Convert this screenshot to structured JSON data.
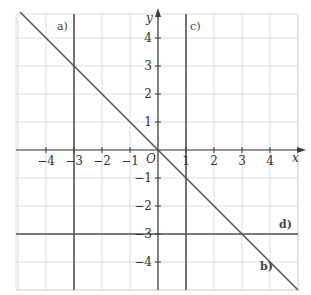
{
  "chart_data": {
    "type": "line",
    "title": "",
    "xlabel": "x",
    "ylabel": "y",
    "origin_label": "O",
    "xlim": [
      -5,
      5
    ],
    "ylim": [
      -5,
      5
    ],
    "grid": true,
    "x_ticks": [
      -4,
      -3,
      -2,
      -1,
      1,
      2,
      3,
      4
    ],
    "y_ticks": [
      -4,
      -3,
      -2,
      -1,
      1,
      2,
      3,
      4
    ],
    "x_tick_labels": [
      "−4",
      "−3",
      "−2",
      "−1",
      "1",
      "2",
      "3",
      "4"
    ],
    "y_tick_labels": [
      "−4",
      "−3",
      "−2",
      "−1",
      "1",
      "2",
      "3",
      "4"
    ],
    "series": [
      {
        "name": "a)",
        "equation": "x = -3",
        "kind": "vertical",
        "value": -3
      },
      {
        "name": "b)",
        "equation": "y = -x",
        "kind": "linear",
        "slope": -1,
        "intercept": 0,
        "x": [
          -5,
          5
        ],
        "y": [
          5,
          -5
        ]
      },
      {
        "name": "c)",
        "equation": "x = 1",
        "kind": "vertical",
        "value": 1
      },
      {
        "name": "d)",
        "equation": "y = -3",
        "kind": "horizontal",
        "value": -3
      }
    ]
  },
  "labels": {
    "x_axis": "x",
    "y_axis": "y",
    "origin": "O",
    "line_a": "a)",
    "line_b": "b)",
    "line_c": "c)",
    "line_d": "d)"
  }
}
